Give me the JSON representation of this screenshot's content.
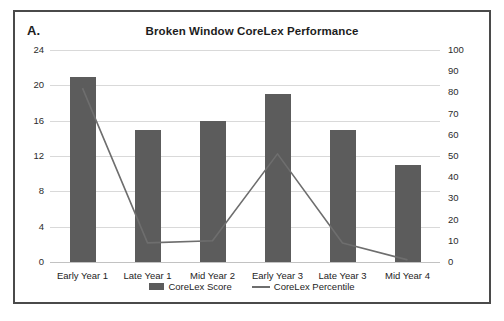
{
  "figure": {
    "panel_label": "A.",
    "title": "Broken Window CoreLex Performance",
    "frame_color": "#4a4a4a"
  },
  "legend": {
    "position": "bottom-center",
    "items": [
      {
        "label": "CoreLex Score",
        "marker": "bar-swatch",
        "color": "#5c5c5c"
      },
      {
        "label": "CoreLex Percentile",
        "marker": "line-swatch",
        "color": "#6e6e6e"
      }
    ]
  },
  "axes": {
    "left": {
      "ticks": [
        "0",
        "4",
        "8",
        "12",
        "16",
        "20",
        "24"
      ],
      "min": 0,
      "max": 24,
      "step": 4
    },
    "right": {
      "ticks": [
        "0",
        "10",
        "20",
        "30",
        "40",
        "50",
        "60",
        "70",
        "80",
        "90",
        "100"
      ],
      "min": 0,
      "max": 100,
      "step": 10
    }
  },
  "chart_data": {
    "type": "bar",
    "title": "Broken Window CoreLex Performance",
    "subtitle": "",
    "xlabel": "",
    "ylabel": "",
    "grid": true,
    "legend_position": "bottom",
    "categories": [
      "Early Year 1",
      "Late Year 1",
      "Mid Year 2",
      "Early Year 3",
      "Late Year 3",
      "Mid Year 4"
    ],
    "series": [
      {
        "name": "CoreLex Score",
        "type": "bar",
        "axis": "left",
        "color": "#5c5c5c",
        "values": [
          21,
          15,
          16,
          19,
          15,
          11
        ]
      },
      {
        "name": "CoreLex Percentile",
        "type": "line",
        "axis": "right",
        "color": "#6e6e6e",
        "values": [
          82,
          9,
          10,
          51,
          9,
          1
        ]
      }
    ],
    "ylim": [
      0,
      24
    ],
    "y2lim": [
      0,
      100
    ],
    "ytick_labels": [
      "0",
      "4",
      "8",
      "12",
      "16",
      "20",
      "24"
    ],
    "y2tick_labels": [
      "0",
      "10",
      "20",
      "30",
      "40",
      "50",
      "60",
      "70",
      "80",
      "90",
      "100"
    ]
  }
}
